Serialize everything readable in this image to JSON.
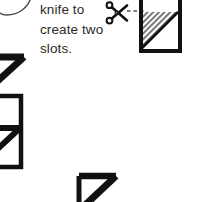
{
  "page": {
    "kind": "craft-instruction-diagram-crop",
    "background_color": "#ffffff",
    "width": 198,
    "height": 202
  },
  "instruction": {
    "text": "knife to\ncreate two\nslots.",
    "lines": [
      "knife to",
      "create two",
      "slots."
    ],
    "color": "#2b2b2b"
  },
  "icons": {
    "scissors": {
      "name": "scissors-icon",
      "glyph": "✂",
      "color": "#111111"
    }
  },
  "cut_line": {
    "name": "dashed-cut-line",
    "style": "dashed",
    "color": "#555555",
    "x1": 128,
    "y1": 11,
    "x2": 143,
    "y2": 11
  },
  "diagrams": {
    "hatched_box": {
      "name": "hatched-slot-box",
      "stroke_color": "#111111",
      "fill_pattern": "diagonal-hatch",
      "hatch_color": "#6d6d6d",
      "x": 140,
      "y": -6,
      "width": 41,
      "height": 58,
      "triangle_note": "lower-left triangle of upper region is hatched"
    },
    "arc": {
      "name": "curved-guide-arc",
      "stroke_color": "#4a4a4a",
      "stroke_width": 1.4
    },
    "flap_shapes": [
      {
        "name": "flap-shape-upper-left",
        "stroke_color": "#111111",
        "stroke_width": 7
      },
      {
        "name": "flap-shape-mid-left",
        "stroke_color": "#111111",
        "stroke_width": 7
      },
      {
        "name": "flap-shape-bottom-center",
        "stroke_color": "#111111",
        "stroke_width": 7
      }
    ]
  }
}
